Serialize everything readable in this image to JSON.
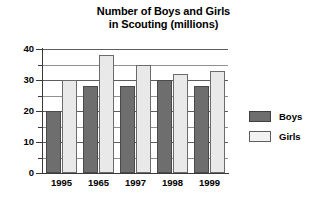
{
  "chart_data": {
    "type": "bar",
    "title": "Number of Boys and Girls in Scouting (millions)",
    "title_line1": "Number of Boys and Girls",
    "title_line2": "in Scouting (millions)",
    "xlabel": "",
    "ylabel": "",
    "ylim": [
      0,
      40
    ],
    "ytick_step": 10,
    "yminor_step": 5,
    "grid": true,
    "grid_axis": "y",
    "legend_position": "right",
    "categories": [
      "1995",
      "1965",
      "1997",
      "1998",
      "1999"
    ],
    "yticks": [
      "0",
      "10",
      "20",
      "30",
      "40"
    ],
    "yticks_values": [
      0,
      10,
      20,
      30,
      40
    ],
    "gridline_values": [
      5,
      10,
      15,
      20,
      25,
      30,
      35,
      40
    ],
    "series": [
      {
        "name": "Boys",
        "color": "#6e6e6e",
        "values": [
          20,
          28,
          28,
          30,
          28
        ]
      },
      {
        "name": "Girls",
        "color": "#e9e9e9",
        "values": [
          30,
          38,
          35,
          32,
          33
        ]
      }
    ]
  },
  "legend": {
    "items": [
      {
        "label": "Boys"
      },
      {
        "label": "Girls"
      }
    ]
  }
}
